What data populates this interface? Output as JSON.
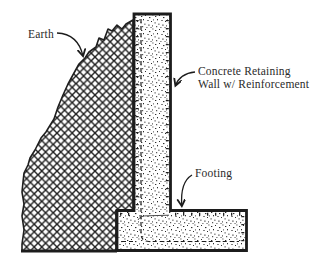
{
  "figure": {
    "labels": {
      "earth": "Earth",
      "wall_line1": "Concrete Retaining",
      "wall_line2": "Wall w/ Reinforcement",
      "footing": "Footing"
    },
    "colors": {
      "ink": "#1c1c1c",
      "background": "#ffffff"
    }
  }
}
